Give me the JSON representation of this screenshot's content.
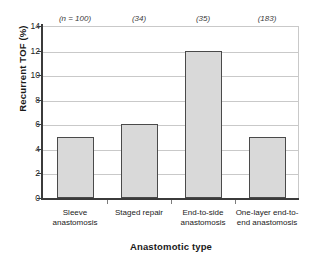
{
  "chart_data": {
    "type": "bar",
    "title": "",
    "xlabel": "Anastomotic type",
    "ylabel": "Recurrent TOF (%)",
    "categories": [
      "Sleeve anastomosis",
      "Staged repair",
      "End-to-side anastomosis",
      "One-layer end-to-end anastomosis"
    ],
    "category_lines": [
      [
        "Sleeve",
        "anastomosis"
      ],
      [
        "Staged repair"
      ],
      [
        "End-to-side",
        "anastomosis"
      ],
      [
        "One-layer end-to-",
        "end anastomosis"
      ]
    ],
    "values": [
      5,
      6,
      12,
      5
    ],
    "annotations": [
      "(n = 100)",
      "(34)",
      "(35)",
      "(183)"
    ],
    "ylim": [
      0,
      14
    ],
    "yticks": [
      0,
      2,
      4,
      6,
      8,
      10,
      12,
      14
    ],
    "ytick_labels": [
      "0",
      "2",
      "4",
      "6",
      "8",
      "10",
      "12",
      "14"
    ],
    "grid": true,
    "grid_axis": "y",
    "legend": "none",
    "bar_fill_color": "#d9d9d9",
    "bar_edge_color": "#4a4a4a",
    "grid_color": "#c9c9c9",
    "axis_color": "#3b3b3b",
    "background_color": "#ffffff"
  }
}
